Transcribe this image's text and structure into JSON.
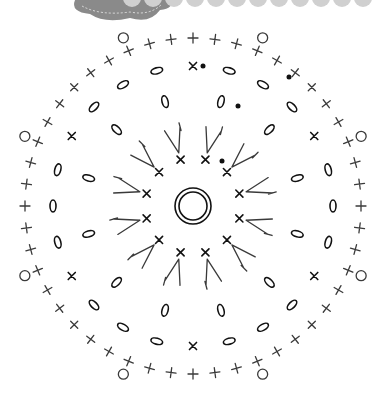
{
  "diagram": {
    "type": "crochet-chart",
    "center": {
      "x": 193,
      "y": 206
    },
    "header": {
      "cloud_color": "#8a8a8a",
      "scallop_color": "#cfcfcf",
      "scallop_count": 12
    },
    "rounds": [
      {
        "name": "round-1",
        "symbol": "single-crochet",
        "count": 12,
        "radius": 48
      },
      {
        "name": "round-2",
        "symbol": "treble-cluster",
        "count": 12,
        "radius": 80
      },
      {
        "name": "round-3",
        "symbol": "chain",
        "count": 12,
        "radius": 108
      },
      {
        "name": "round-4",
        "symbol": "chain-with-sc",
        "count": 24,
        "radius": 140
      },
      {
        "name": "round-5",
        "symbol": "single-crochet-edge",
        "count": 48,
        "radius": 168
      },
      {
        "name": "round-6",
        "symbol": "picot",
        "count": 8,
        "radius": 182
      }
    ],
    "markers": [
      {
        "x": 203,
        "y": 66
      },
      {
        "x": 289,
        "y": 77
      },
      {
        "x": 238,
        "y": 106
      },
      {
        "x": 222,
        "y": 161
      }
    ],
    "colors": {
      "ink": "#3a3a3a",
      "dark": "#111111",
      "background": "#ffffff"
    }
  }
}
